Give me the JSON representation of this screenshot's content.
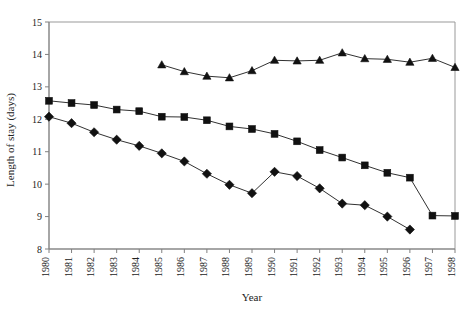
{
  "chart_data": {
    "type": "line",
    "title": "",
    "xlabel": "Year",
    "ylabel": "Length of stay (days)",
    "xlim": [
      1980,
      1998
    ],
    "ylim": [
      8,
      15
    ],
    "yticks": [
      8,
      9,
      10,
      11,
      12,
      13,
      14,
      15
    ],
    "grid": false,
    "legend": "none",
    "x": [
      1980,
      1981,
      1982,
      1983,
      1984,
      1985,
      1986,
      1987,
      1988,
      1989,
      1990,
      1991,
      1992,
      1993,
      1994,
      1995,
      1996,
      1997,
      1998
    ],
    "categories": [
      "1980",
      "1981",
      "1982",
      "1983",
      "1984",
      "1985",
      "1986",
      "1987",
      "1988",
      "1989",
      "1990",
      "1991",
      "1992",
      "1993",
      "1994",
      "1995",
      "1996",
      "1997",
      "1998"
    ],
    "series": [
      {
        "name": "triangle-series",
        "marker": "triangle",
        "color": "#111111",
        "x": [
          1985,
          1986,
          1987,
          1988,
          1989,
          1990,
          1991,
          1992,
          1993,
          1994,
          1995,
          1996,
          1997,
          1998
        ],
        "values": [
          13.68,
          13.47,
          13.33,
          13.28,
          13.5,
          13.82,
          13.8,
          13.82,
          14.05,
          13.87,
          13.85,
          13.76,
          13.88,
          13.6
        ]
      },
      {
        "name": "square-series",
        "marker": "square",
        "color": "#111111",
        "x": [
          1980,
          1981,
          1982,
          1983,
          1984,
          1985,
          1986,
          1987,
          1988,
          1989,
          1990,
          1991,
          1992,
          1993,
          1994,
          1995,
          1996,
          1997,
          1998
        ],
        "values": [
          12.57,
          12.5,
          12.44,
          12.3,
          12.25,
          12.08,
          12.07,
          11.97,
          11.78,
          11.7,
          11.55,
          11.32,
          11.05,
          10.82,
          10.58,
          10.35,
          10.2,
          9.03,
          9.02
        ]
      },
      {
        "name": "diamond-series",
        "marker": "diamond",
        "color": "#111111",
        "x": [
          1980,
          1981,
          1982,
          1983,
          1984,
          1985,
          1986,
          1987,
          1988,
          1989,
          1990,
          1991,
          1992,
          1993,
          1994,
          1995,
          1996
        ],
        "values": [
          12.08,
          11.88,
          11.6,
          11.37,
          11.18,
          10.95,
          10.7,
          10.32,
          9.98,
          9.72,
          10.38,
          10.25,
          9.87,
          9.4,
          9.35,
          9.0,
          8.6
        ]
      }
    ]
  },
  "axis": {
    "x_label": "Year",
    "y_label": "Length of stay (days)"
  }
}
